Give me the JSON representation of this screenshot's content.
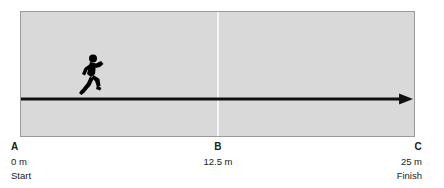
{
  "diagram": {
    "type": "motion-track-diagram",
    "colors": {
      "panel_background": "#d9d9d9",
      "panel_border": "#9a9a9a",
      "track_line": "#111111",
      "midline": "#f4f4f4",
      "figure": "#000000",
      "text": "#1a1a1a",
      "page_background": "#ffffff"
    },
    "figure": {
      "icon": "running-person-icon",
      "facing": "right"
    },
    "track": {
      "icon": "arrow-right-icon",
      "start_value": "0 m",
      "end_value": "25 m"
    },
    "markers": [
      {
        "point": "A",
        "distance": "0 m",
        "note": "Start"
      },
      {
        "point": "B",
        "distance": "12.5 m",
        "note": ""
      },
      {
        "point": "C",
        "distance": "25 m",
        "note": "Finish"
      }
    ]
  },
  "chart_data": {
    "type": "diagram",
    "title": "",
    "xlabel": "",
    "ylabel": "",
    "categories": [
      "A",
      "B",
      "C"
    ],
    "values": [
      0,
      12.5,
      25
    ],
    "tick_labels": [
      "0 m",
      "12.5 m",
      "25 m"
    ],
    "annotations": [
      "Start",
      "",
      "Finish"
    ],
    "xlim": [
      0,
      25
    ],
    "grid": false,
    "legend": "none"
  }
}
